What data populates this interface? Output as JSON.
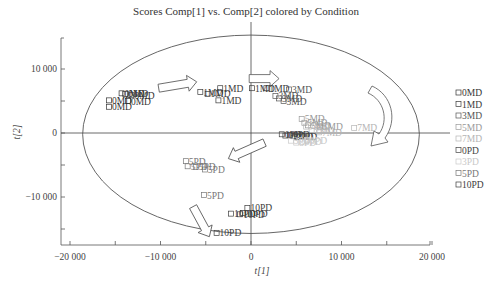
{
  "chart_data": {
    "type": "scatter",
    "title": "Scores Comp[1] vs. Comp[2] colored by Condition",
    "xlabel": "t[1]",
    "ylabel": "t[2]",
    "xlim": [
      -21000,
      21000
    ],
    "ylim": [
      -18000,
      15000
    ],
    "xticks": [
      -20000,
      -10000,
      0,
      10000,
      20000
    ],
    "xtick_labels": [
      "−20 000",
      "−10 000",
      "0",
      "10 000",
      "20 000"
    ],
    "yticks": [
      -10000,
      0,
      10000
    ],
    "ytick_labels": [
      "−10 000",
      "0",
      "10 000"
    ],
    "grid": false,
    "legend_position": "right",
    "ellipse": {
      "cx": 0,
      "cy": -200,
      "rx": 18600,
      "ry": 15500,
      "label": "Hotelling T2 ellipse"
    },
    "series": [
      {
        "name": "0MD",
        "color": "#333333",
        "points": [
          [
            -14300,
            6200
          ],
          [
            -13900,
            6100
          ],
          [
            -13200,
            5900
          ],
          [
            -15700,
            5100
          ],
          [
            -13600,
            5000
          ],
          [
            -15700,
            4100
          ]
        ]
      },
      {
        "name": "1MD",
        "color": "#3a3a3a",
        "points": [
          [
            -5600,
            6400
          ],
          [
            -4800,
            6100
          ],
          [
            -3400,
            7000
          ],
          [
            -3600,
            5100
          ],
          [
            100,
            7000
          ],
          [
            1700,
            7000
          ]
        ]
      },
      {
        "name": "3MD",
        "color": "#555555",
        "points": [
          [
            2700,
            5800
          ],
          [
            3100,
            5400
          ],
          [
            3600,
            5000
          ],
          [
            4200,
            6800
          ]
        ]
      },
      {
        "name": "5MD",
        "color": "#9a9a9a",
        "points": [
          [
            5600,
            2200
          ],
          [
            5900,
            1600
          ],
          [
            6300,
            1200
          ],
          [
            7600,
            1000
          ]
        ]
      },
      {
        "name": "7MD",
        "color": "#b5b5b5",
        "points": [
          [
            6100,
            1000
          ],
          [
            6700,
            400
          ],
          [
            7500,
            100
          ],
          [
            11400,
            800
          ]
        ]
      },
      {
        "name": "0PD",
        "color": "#444444",
        "points": [
          [
            3400,
            -200
          ],
          [
            3800,
            -400
          ],
          [
            4300,
            -300
          ],
          [
            4700,
            -500
          ],
          [
            5100,
            -600
          ]
        ]
      },
      {
        "name": "3PD",
        "color": "#c8c8c8",
        "points": [
          [
            4400,
            -1200
          ],
          [
            5000,
            -1500
          ],
          [
            5600,
            -1400
          ],
          [
            6200,
            -1100
          ]
        ]
      },
      {
        "name": "5PD",
        "color": "#777777",
        "points": [
          [
            -7200,
            -4400
          ],
          [
            -7000,
            -5200
          ],
          [
            -6100,
            -5300
          ],
          [
            -5100,
            -5700
          ],
          [
            -5200,
            -9700
          ]
        ]
      },
      {
        "name": "10PD",
        "color": "#3c3c3c",
        "points": [
          [
            -400,
            -11700
          ],
          [
            -2200,
            -12600
          ],
          [
            -1200,
            -12700
          ],
          [
            -900,
            -12500
          ],
          [
            -3800,
            -15600
          ]
        ]
      }
    ],
    "annotations": [
      {
        "type": "arrow",
        "description": "0MD → 1MD",
        "from": [
          -10200,
          7000
        ],
        "to": [
          -6000,
          8000
        ]
      },
      {
        "type": "arrow",
        "description": "1MD → 3MD",
        "from": [
          -200,
          8500
        ],
        "to": [
          3100,
          8500
        ]
      },
      {
        "type": "arrow",
        "description": "curved arrow 3MD/5MD → 7MD/PD",
        "from": [
          10500,
          6000
        ],
        "to": [
          11000,
          -1800
        ]
      },
      {
        "type": "arrow",
        "description": "PD → 5PD",
        "from": [
          1500,
          -1500
        ],
        "to": [
          -2500,
          -4000
        ]
      },
      {
        "type": "arrow",
        "description": "5PD → 10PD",
        "from": [
          -6400,
          -11500
        ],
        "to": [
          -4600,
          -16200
        ]
      }
    ]
  },
  "legend": {
    "items": [
      {
        "label": "0MD",
        "color": "#333333"
      },
      {
        "label": "1MD",
        "color": "#3a3a3a"
      },
      {
        "label": "3MD",
        "color": "#555555"
      },
      {
        "label": "5MD",
        "color": "#9a9a9a"
      },
      {
        "label": "7MD",
        "color": "#b5b5b5"
      },
      {
        "label": "0PD",
        "color": "#444444"
      },
      {
        "label": "3PD",
        "color": "#c8c8c8"
      },
      {
        "label": "5PD",
        "color": "#777777"
      },
      {
        "label": "10PD",
        "color": "#3c3c3c"
      }
    ]
  }
}
